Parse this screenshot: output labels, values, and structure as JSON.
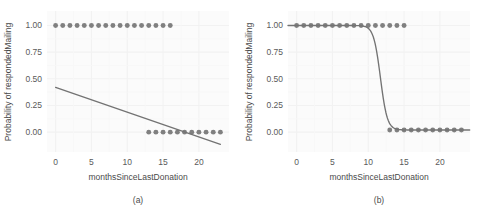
{
  "figure": {
    "background_color": "#ffffff",
    "panel_background_color": "#fbfbfb",
    "grid_color": "#f2f2f2",
    "point_color": "#808080",
    "line_color": "#737373",
    "text_color": "#4d4d4d",
    "panel_count": 2
  },
  "chart_data": [
    {
      "type": "scatter",
      "panel_label": "(a)",
      "title": "",
      "subtitle": "",
      "xlabel": "monthsSinceLastDonation",
      "ylabel": "Probability of respondedMailing",
      "xlim": [
        -1.2,
        24.2
      ],
      "ylim": [
        -0.13,
        1.07
      ],
      "xticks": [
        0,
        5,
        10,
        15,
        20
      ],
      "xticklabels": [
        "0",
        "5",
        "10",
        "15",
        "20"
      ],
      "yticks": [
        0.0,
        0.25,
        0.5,
        0.75,
        1.0
      ],
      "yticklabels": [
        "0.00",
        "0.25",
        "0.50",
        "0.75",
        "1.00"
      ],
      "grid": true,
      "legend": null,
      "legend_position": "none",
      "series": [
        {
          "name": "observed responses",
          "type": "scatter",
          "marker": "circle",
          "color": "#808080",
          "x": [
            0,
            1,
            2,
            3,
            4,
            5,
            6,
            7,
            8,
            9,
            10,
            11,
            12,
            13,
            14,
            15,
            16,
            13,
            14,
            15,
            16,
            17,
            18,
            19,
            20,
            21,
            22,
            23
          ],
          "y": [
            1,
            1,
            1,
            1,
            1,
            1,
            1,
            1,
            1,
            1,
            1,
            1,
            1,
            1,
            1,
            1,
            1,
            0,
            0,
            0,
            0,
            0,
            0,
            0,
            0,
            0,
            0,
            0
          ]
        },
        {
          "name": "linear regression fit",
          "type": "line",
          "color": "#737373",
          "x": [
            0,
            23
          ],
          "y": [
            0.42,
            -0.115
          ],
          "intercept": 0.42,
          "slope": -0.02326
        }
      ]
    },
    {
      "type": "scatter",
      "panel_label": "(b)",
      "title": "",
      "subtitle": "",
      "xlabel": "monthsSinceLastDonation",
      "ylabel": "Probability of respondedMailing",
      "xlim": [
        -1.2,
        24.2
      ],
      "ylim": [
        -0.13,
        1.07
      ],
      "xticks": [
        0,
        5,
        10,
        15,
        20
      ],
      "xticklabels": [
        "0",
        "5",
        "10",
        "15",
        "20"
      ],
      "yticks": [
        0.0,
        0.25,
        0.5,
        0.75,
        1.0
      ],
      "yticklabels": [
        "0.00",
        "0.25",
        "0.50",
        "0.75",
        "1.00"
      ],
      "grid": true,
      "legend": null,
      "legend_position": "none",
      "series": [
        {
          "name": "observed responses",
          "type": "scatter",
          "marker": "circle",
          "color": "#808080",
          "x": [
            0,
            1,
            2,
            3,
            4,
            5,
            6,
            7,
            8,
            9,
            10,
            11,
            12,
            13,
            14,
            15,
            13,
            14,
            15,
            16,
            17,
            18,
            19,
            20,
            21,
            22,
            23
          ],
          "y": [
            1,
            1,
            1,
            1,
            1,
            1,
            1,
            1,
            1,
            1,
            1,
            1,
            1,
            1,
            1,
            1,
            0.02,
            0.02,
            0.02,
            0.02,
            0.02,
            0.02,
            0.02,
            0.02,
            0.02,
            0.02,
            0.02
          ]
        },
        {
          "name": "logistic regression fit",
          "type": "line",
          "color": "#737373",
          "midpoint": 11.7,
          "steepness": 2.1,
          "lower_asymptote": 0.02,
          "upper_asymptote": 1.0
        }
      ]
    }
  ]
}
